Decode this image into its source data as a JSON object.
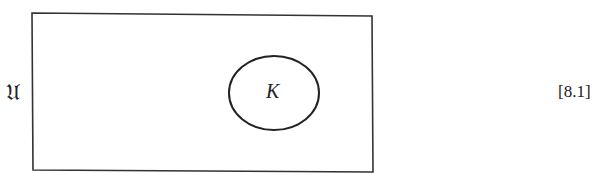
{
  "diagram": {
    "universe_label": "𝔘",
    "set_label": "K",
    "equation_number": "[8.1]",
    "colors": {
      "stroke": "#333333",
      "background": "#ffffff"
    }
  }
}
